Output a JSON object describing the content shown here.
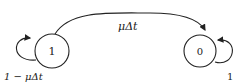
{
  "diagram": {
    "type": "state-transition",
    "states": [
      {
        "id": "state-1",
        "label": "1",
        "self_loop_label": "1 − μΔt"
      },
      {
        "id": "state-0",
        "label": "0",
        "self_loop_label": "1"
      }
    ],
    "transitions": [
      {
        "from": "1",
        "to": "0",
        "label": "μΔt"
      }
    ],
    "colors": {
      "stroke": "#222222",
      "background": "#ffffff"
    }
  }
}
